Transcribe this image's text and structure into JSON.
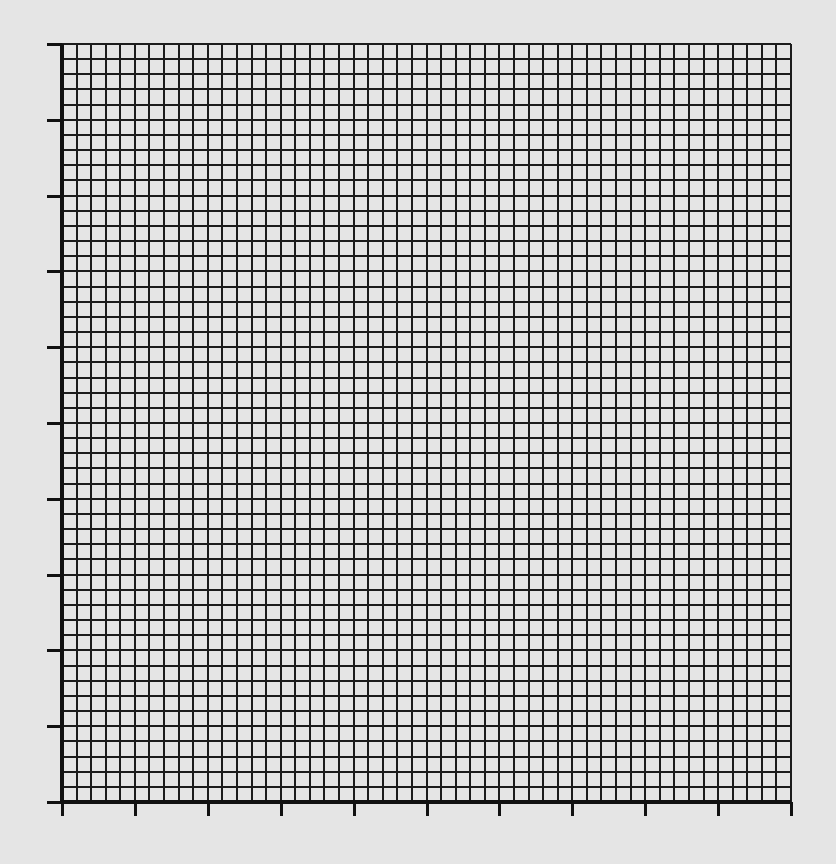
{
  "chart_data": {
    "type": "line",
    "title": "",
    "xlabel": "",
    "ylabel": "",
    "series": [],
    "grid": true,
    "legend": null,
    "x_major_divisions": 10,
    "y_major_divisions": 10,
    "minor_per_major": 5,
    "x_tick_labels": [],
    "y_tick_labels": [],
    "xlim": [
      0,
      10
    ],
    "ylim": [
      0,
      10
    ],
    "plot_area_px": {
      "left": 62,
      "top": 44,
      "right": 791,
      "bottom": 802
    },
    "tick_length_px": {
      "left": 15,
      "bottom": 14
    }
  },
  "colors": {
    "paper": "#e5e5e5",
    "grid_line": "#1c1c1c",
    "axis_line": "#111111"
  }
}
